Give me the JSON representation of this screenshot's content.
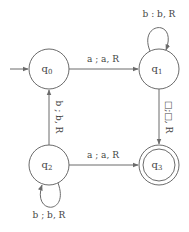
{
  "diagram": {
    "type": "turing-machine-state-diagram",
    "states": [
      {
        "id": "q0",
        "name": "q",
        "sub": "0",
        "start": true,
        "accepting": false
      },
      {
        "id": "q1",
        "name": "q",
        "sub": "1",
        "start": false,
        "accepting": false
      },
      {
        "id": "q2",
        "name": "q",
        "sub": "2",
        "start": false,
        "accepting": false
      },
      {
        "id": "q3",
        "name": "q",
        "sub": "3",
        "start": false,
        "accepting": true
      }
    ],
    "transitions": [
      {
        "from": "q0",
        "to": "q1",
        "label": "a ; a, R"
      },
      {
        "from": "q1",
        "to": "q1",
        "label": "b : b, R"
      },
      {
        "from": "q1",
        "to": "q3",
        "label": "□;□, R"
      },
      {
        "from": "q2",
        "to": "q0",
        "label": "b ; b, R"
      },
      {
        "from": "q2",
        "to": "q3",
        "label": "a ; a, R"
      },
      {
        "from": "q2",
        "to": "q2",
        "label": "b ; b, R"
      }
    ],
    "colors": {
      "stroke": "#6b6b6b",
      "text": "#444444",
      "background": "#ffffff"
    }
  }
}
